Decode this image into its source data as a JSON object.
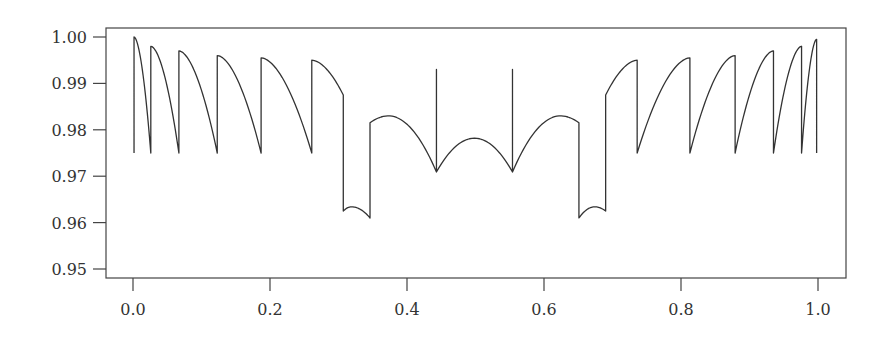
{
  "chart_data": {
    "type": "line",
    "title": "",
    "xlabel": "",
    "ylabel": "",
    "xlim": [
      -0.04,
      1.04
    ],
    "ylim": [
      0.948,
      1.002
    ],
    "grid": false,
    "legend": null,
    "x_ticks": [
      0.0,
      0.2,
      0.4,
      0.6,
      0.8,
      1.0
    ],
    "x_tick_labels": [
      "0.0",
      "0.2",
      "0.4",
      "0.6",
      "0.8",
      "1.0"
    ],
    "y_ticks": [
      1.0,
      0.99,
      0.98,
      0.97,
      0.96,
      0.95
    ],
    "y_tick_labels": [
      "1.00",
      "0.99",
      "0.98",
      "0.97",
      "0.96",
      "0.95"
    ],
    "line_color": "#333333",
    "series": [
      {
        "name": "curve",
        "segments": [
          {
            "kind": "vline",
            "x": 0.0015,
            "y0": 0.975,
            "y1": 1.0
          },
          {
            "kind": "decay",
            "x0": 0.0015,
            "y0": 1.0,
            "x1": 0.026,
            "y1": 0.975
          },
          {
            "kind": "vline",
            "x": 0.026,
            "y0": 0.975,
            "y1": 0.998
          },
          {
            "kind": "decay",
            "x0": 0.026,
            "y0": 0.998,
            "x1": 0.067,
            "y1": 0.975
          },
          {
            "kind": "vline",
            "x": 0.067,
            "y0": 0.975,
            "y1": 0.997
          },
          {
            "kind": "decay",
            "x0": 0.067,
            "y0": 0.997,
            "x1": 0.123,
            "y1": 0.975
          },
          {
            "kind": "vline",
            "x": 0.123,
            "y0": 0.975,
            "y1": 0.996
          },
          {
            "kind": "decay",
            "x0": 0.123,
            "y0": 0.996,
            "x1": 0.187,
            "y1": 0.975
          },
          {
            "kind": "vline",
            "x": 0.187,
            "y0": 0.975,
            "y1": 0.9955
          },
          {
            "kind": "decay",
            "x0": 0.187,
            "y0": 0.9955,
            "x1": 0.261,
            "y1": 0.975
          },
          {
            "kind": "vline",
            "x": 0.261,
            "y0": 0.975,
            "y1": 0.995
          },
          {
            "kind": "decay",
            "x0": 0.261,
            "y0": 0.995,
            "x1": 0.307,
            "y1": 0.9875
          },
          {
            "kind": "vline",
            "x": 0.307,
            "y0": 0.9875,
            "y1": 0.9625
          },
          {
            "kind": "arch",
            "x0": 0.307,
            "y0": 0.9625,
            "xm": 0.319,
            "ym": 0.9634,
            "x1": 0.346,
            "y1": 0.961
          },
          {
            "kind": "vline",
            "x": 0.346,
            "y0": 0.961,
            "y1": 0.9815
          },
          {
            "kind": "arch",
            "x0": 0.346,
            "y0": 0.9815,
            "xm": 0.373,
            "ym": 0.983,
            "x1": 0.443,
            "y1": 0.9709
          },
          {
            "kind": "vline",
            "x": 0.443,
            "y0": 0.9709,
            "y1": 0.993
          },
          {
            "kind": "vline",
            "x": 0.443,
            "y0": 0.993,
            "y1": 0.9709
          },
          {
            "kind": "arch",
            "x0": 0.443,
            "y0": 0.9709,
            "xm": 0.4985,
            "ym": 0.9782,
            "x1": 0.554,
            "y1": 0.9709
          },
          {
            "kind": "vline",
            "x": 0.554,
            "y0": 0.9709,
            "y1": 0.993
          },
          {
            "kind": "vline",
            "x": 0.554,
            "y0": 0.993,
            "y1": 0.9709
          },
          {
            "kind": "arch",
            "x0": 0.554,
            "y0": 0.9709,
            "xm": 0.624,
            "ym": 0.983,
            "x1": 0.651,
            "y1": 0.9815
          },
          {
            "kind": "vline",
            "x": 0.651,
            "y0": 0.9815,
            "y1": 0.961
          },
          {
            "kind": "arch",
            "x0": 0.651,
            "y0": 0.961,
            "xm": 0.674,
            "ym": 0.9634,
            "x1": 0.69,
            "y1": 0.9625
          },
          {
            "kind": "vline",
            "x": 0.69,
            "y0": 0.9625,
            "y1": 0.9875
          },
          {
            "kind": "rise",
            "x0": 0.69,
            "y0": 0.9875,
            "x1": 0.736,
            "y1": 0.995
          },
          {
            "kind": "vline",
            "x": 0.736,
            "y0": 0.995,
            "y1": 0.975
          },
          {
            "kind": "rise",
            "x0": 0.736,
            "y0": 0.975,
            "x1": 0.813,
            "y1": 0.9955
          },
          {
            "kind": "vline",
            "x": 0.813,
            "y0": 0.9955,
            "y1": 0.975
          },
          {
            "kind": "rise",
            "x0": 0.813,
            "y0": 0.975,
            "x1": 0.879,
            "y1": 0.996
          },
          {
            "kind": "vline",
            "x": 0.879,
            "y0": 0.996,
            "y1": 0.975
          },
          {
            "kind": "rise",
            "x0": 0.879,
            "y0": 0.975,
            "x1": 0.935,
            "y1": 0.997
          },
          {
            "kind": "vline",
            "x": 0.935,
            "y0": 0.997,
            "y1": 0.975
          },
          {
            "kind": "rise",
            "x0": 0.935,
            "y0": 0.975,
            "x1": 0.976,
            "y1": 0.998
          },
          {
            "kind": "vline",
            "x": 0.976,
            "y0": 0.998,
            "y1": 0.975
          },
          {
            "kind": "rise",
            "x0": 0.976,
            "y0": 0.975,
            "x1": 0.998,
            "y1": 0.9995
          },
          {
            "kind": "vline",
            "x": 0.998,
            "y0": 0.9995,
            "y1": 0.975
          }
        ]
      }
    ]
  }
}
